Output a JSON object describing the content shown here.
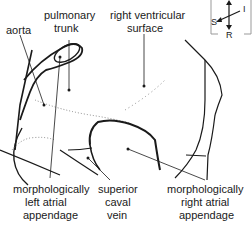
{
  "diagram": {
    "type": "anatomical-line-drawing",
    "labels": {
      "aorta": "aorta",
      "pulmonary_trunk_line1": "pulmonary",
      "pulmonary_trunk_line2": "trunk",
      "right_ventricular_line1": "right ventricular",
      "right_ventricular_line2": "surface",
      "left_atrial_line1": "morphologically",
      "left_atrial_line2": "left atrial",
      "left_atrial_line3": "appendage",
      "svc_line1": "superior",
      "svc_line2": "caval",
      "svc_line3": "vein",
      "right_atrial_line1": "morphologically",
      "right_atrial_line2": "right atrial",
      "right_atrial_line3": "appendage"
    },
    "orientation_compass": {
      "S": "S",
      "I": "I",
      "R": "R"
    },
    "colors": {
      "line": "#1a1a1a",
      "stipple": "#555555",
      "background": "#ffffff"
    }
  }
}
